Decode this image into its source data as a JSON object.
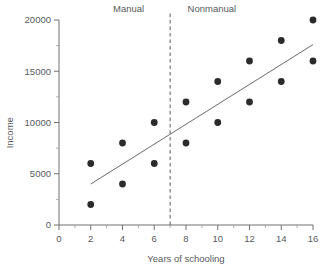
{
  "chart_data": {
    "type": "scatter",
    "title": "",
    "xlabel": "Years of schooling",
    "ylabel": "Income",
    "xlim": [
      0,
      16
    ],
    "ylim": [
      0,
      20000
    ],
    "grid": false,
    "legend_position": "none",
    "x_ticks": [
      0,
      2,
      4,
      6,
      8,
      10,
      12,
      14,
      16
    ],
    "x_tick_labels": [
      "0",
      "2",
      "4",
      "6",
      "8",
      "10",
      "12",
      "14",
      "16"
    ],
    "x_minor_ticks": [
      1,
      3,
      5,
      7,
      9,
      11,
      13,
      15
    ],
    "y_ticks": [
      0,
      5000,
      10000,
      15000,
      20000
    ],
    "y_tick_labels": [
      "0",
      "5000",
      "10000",
      "15000",
      "20000"
    ],
    "y_minor_ticks": [
      2500,
      7500,
      12500,
      17500
    ],
    "points": [
      {
        "x": 2,
        "y": 6000
      },
      {
        "x": 2,
        "y": 2000
      },
      {
        "x": 4,
        "y": 8000
      },
      {
        "x": 4,
        "y": 4000
      },
      {
        "x": 6,
        "y": 10000
      },
      {
        "x": 6,
        "y": 6000
      },
      {
        "x": 8,
        "y": 12000
      },
      {
        "x": 8,
        "y": 8000
      },
      {
        "x": 10,
        "y": 14000
      },
      {
        "x": 10,
        "y": 10000
      },
      {
        "x": 12,
        "y": 16000
      },
      {
        "x": 12,
        "y": 12000
      },
      {
        "x": 14,
        "y": 18000
      },
      {
        "x": 14,
        "y": 14000
      },
      {
        "x": 16,
        "y": 20000
      },
      {
        "x": 16,
        "y": 16000
      }
    ],
    "fit_line": {
      "x_start": 2,
      "y_start": 4000,
      "x_end": 16,
      "y_end": 17600
    },
    "divider": {
      "x": 7,
      "style": "dashed"
    },
    "annotations": [
      {
        "label": "Manual",
        "x": 3.4,
        "y": 20800,
        "region": "left"
      },
      {
        "label": "Nonmanual",
        "x": 8.1,
        "y": 20800,
        "region": "right"
      }
    ],
    "point_color": "#2b2b2d",
    "line_color": "#6a6b6d",
    "axis_color": "#6e7072",
    "text_color": "#58595b"
  }
}
